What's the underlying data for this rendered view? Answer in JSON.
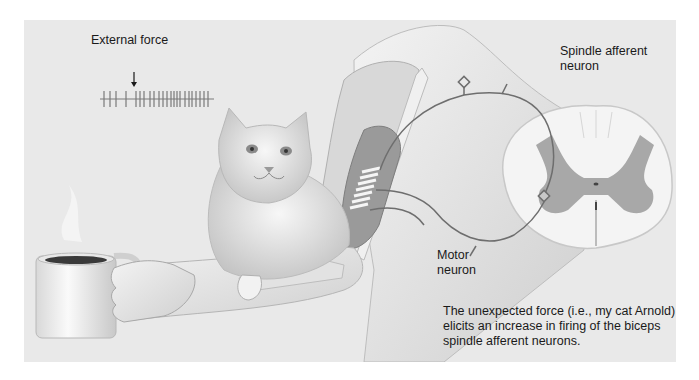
{
  "figure": {
    "labels": {
      "external_force": "External force",
      "spindle_afferent": "Spindle afferent\nneuron",
      "motor_neuron": "Motor\nneuron"
    },
    "caption_lines": [
      "The unexpected force (i.e., my cat Arnold)",
      "elicits an increase in firing of the biceps",
      "spindle afferent neurons."
    ],
    "spike_train": {
      "before_force_spikes": 4,
      "after_force_spikes": 20
    },
    "illustrated_elements": [
      "coffee-mug",
      "hand",
      "forearm",
      "cat",
      "biceps-muscle-spindle",
      "shoulder",
      "spinal-cord-cross-section"
    ],
    "colors": {
      "panel_background": "#e9e9e9",
      "grey_matter": "#a8a8a8",
      "white_matter": "#f4f4f4",
      "nerve_line": "#6e6e6e",
      "muscle": "#9a9a9a",
      "text": "#1a1a1a"
    }
  }
}
